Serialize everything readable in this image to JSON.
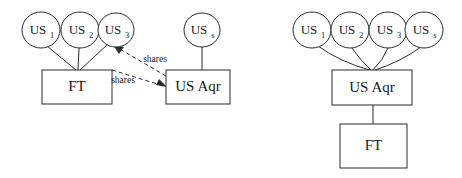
{
  "figure": {
    "background_color": "#ffffff",
    "stroke_color": "#2b2b2b",
    "text_color": "#1a1a1a"
  },
  "diagrams": [
    {
      "id": "left-diagram",
      "name": "before-restructuring",
      "nodes": {
        "circles": [
          {
            "id": "us1",
            "base": "US",
            "sub": "1",
            "cx": 41,
            "cy": 30,
            "r": 18
          },
          {
            "id": "us2",
            "base": "US",
            "sub": "2",
            "cx": 80,
            "cy": 30,
            "r": 18
          },
          {
            "id": "us3",
            "base": "US",
            "sub": "3",
            "cx": 116,
            "cy": 30,
            "r": 17
          },
          {
            "id": "uss",
            "base": "US",
            "sub": "s",
            "cx": 202,
            "cy": 30,
            "r": 17
          }
        ],
        "boxes": [
          {
            "id": "ft",
            "label": "FT",
            "x": 42,
            "y": 70,
            "w": 70,
            "h": 34
          },
          {
            "id": "usaqr",
            "label": "US Aqr",
            "x": 166,
            "y": 70,
            "w": 64,
            "h": 34
          }
        ]
      },
      "edge_labels": [
        {
          "id": "shares-upper",
          "text": "shares",
          "x": 155,
          "y": 60
        },
        {
          "id": "shares-lower",
          "text": "shares",
          "x": 123,
          "y": 81
        }
      ]
    },
    {
      "id": "right-diagram",
      "name": "after-restructuring",
      "nodes": {
        "circles": [
          {
            "id": "us1",
            "base": "US",
            "sub": "1",
            "cx": 312,
            "cy": 30,
            "r": 18
          },
          {
            "id": "us2",
            "base": "US",
            "sub": "2",
            "cx": 350,
            "cy": 30,
            "r": 18
          },
          {
            "id": "us3",
            "base": "US",
            "sub": "3",
            "cx": 388,
            "cy": 30,
            "r": 18
          },
          {
            "id": "uss",
            "base": "US",
            "sub": "s",
            "cx": 424,
            "cy": 30,
            "r": 18
          }
        ],
        "boxes": [
          {
            "id": "usaqr",
            "label": "US Aqr",
            "x": 332,
            "y": 70,
            "w": 80,
            "h": 35
          },
          {
            "id": "ft",
            "label": "FT",
            "x": 340,
            "y": 124,
            "w": 67,
            "h": 44
          }
        ]
      },
      "edge_labels": []
    }
  ]
}
